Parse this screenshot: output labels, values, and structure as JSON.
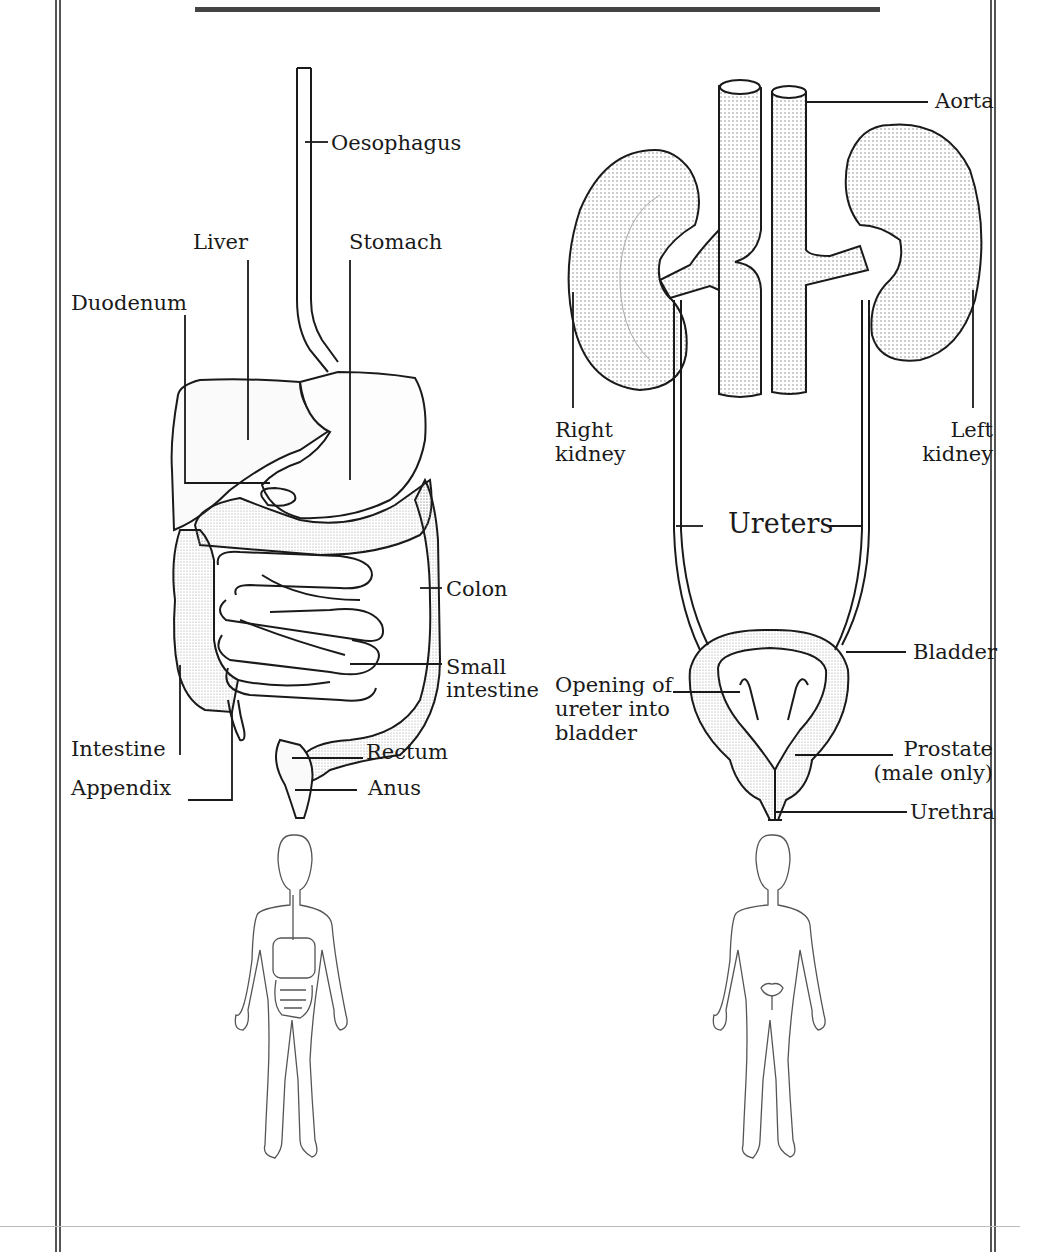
{
  "digestive_system": {
    "labels": {
      "oesophagus": "Oesophagus",
      "liver": "Liver",
      "stomach": "Stomach",
      "duodenum": "Duodenum",
      "colon": "Colon",
      "small_intestine_1": "Small",
      "small_intestine_2": "intestine",
      "intestine": "Intestine",
      "appendix": "Appendix",
      "rectum": "Rectum",
      "anus": "Anus"
    }
  },
  "urinary_system": {
    "labels": {
      "aorta": "Aorta",
      "right_kidney_1": "Right",
      "right_kidney_2": "kidney",
      "left_kidney_1": "Left",
      "left_kidney_2": "kidney",
      "ureters": "Ureters",
      "bladder": "Bladder",
      "opening_1": "Opening of",
      "opening_2": "ureter into",
      "opening_3": "bladder",
      "prostate_1": "Prostate",
      "prostate_2": "(male only)",
      "urethra": "Urethra"
    }
  },
  "figures": {
    "left": "body-outline-digestive-location",
    "right": "body-outline-urinary-location"
  },
  "colors": {
    "ink": "#1a1a1a",
    "frame": "#555555",
    "paper": "#ffffff"
  }
}
